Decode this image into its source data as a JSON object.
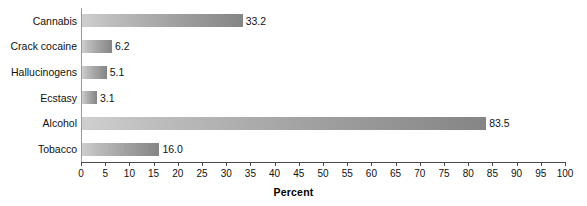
{
  "chart_data": {
    "type": "bar",
    "orientation": "horizontal",
    "title": "",
    "subtitle": "",
    "xlabel": "Percent",
    "ylabel": "",
    "categories": [
      "Cannabis",
      "Crack cocaine",
      "Hallucinogens",
      "Ecstasy",
      "Alcohol",
      "Tobacco"
    ],
    "values": [
      33.2,
      6.2,
      5.1,
      3.1,
      83.5,
      16.0
    ],
    "value_labels": [
      "33.2",
      "6.2",
      "5.1",
      "3.1",
      "83.5",
      "16.0"
    ],
    "xlim": [
      0,
      100
    ],
    "xtick_step": 5,
    "xticks": [
      0,
      5,
      10,
      15,
      20,
      25,
      30,
      35,
      40,
      45,
      50,
      55,
      60,
      65,
      70,
      75,
      80,
      85,
      90,
      95,
      100
    ],
    "xtick_labels": [
      "0",
      "5",
      "10",
      "15",
      "20",
      "25",
      "30",
      "35",
      "40",
      "45",
      "50",
      "55",
      "60",
      "65",
      "70",
      "75",
      "80",
      "85",
      "90",
      "95",
      "100"
    ],
    "grid": false,
    "legend": null,
    "bar_gradient_start": "#cfcfcf",
    "bar_gradient_end": "#858585",
    "axis_color": "#4a4a4a",
    "background": "#ffffff"
  }
}
